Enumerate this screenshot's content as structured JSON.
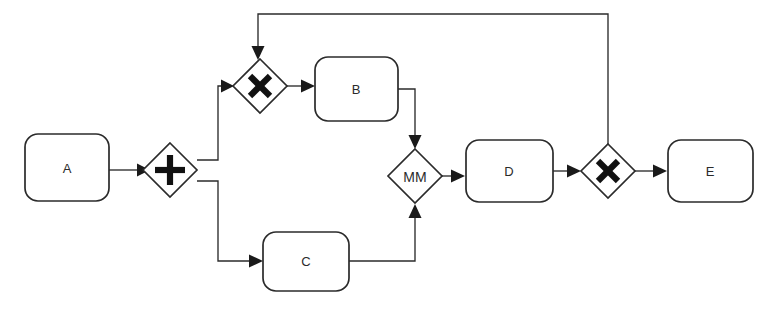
{
  "diagram": {
    "type": "bpmn-process-flow",
    "title": "",
    "background_color": "#ffffff",
    "line_color": "#2b2b2b",
    "fill_color": "#ffffff",
    "tasks": [
      {
        "id": "A",
        "label": "A",
        "x": 25,
        "y": 134,
        "width": 84,
        "height": 67
      },
      {
        "id": "B",
        "label": "B",
        "x": 315,
        "y": 57,
        "width": 83,
        "height": 64
      },
      {
        "id": "C",
        "label": "C",
        "x": 263,
        "y": 232,
        "width": 86,
        "height": 59
      },
      {
        "id": "D",
        "label": "D",
        "x": 466,
        "y": 140,
        "width": 87,
        "height": 62
      },
      {
        "id": "E",
        "label": "E",
        "x": 668,
        "y": 140,
        "width": 85,
        "height": 62
      }
    ],
    "gateways": [
      {
        "id": "G1",
        "label": "",
        "marker": "plus",
        "kind": "parallel-split",
        "cx": 170,
        "cy": 170,
        "r": 27
      },
      {
        "id": "G2",
        "label": "",
        "marker": "cross",
        "kind": "exclusive-merge",
        "cx": 260,
        "cy": 86,
        "r": 27
      },
      {
        "id": "G3",
        "label": "MM",
        "marker": "text",
        "kind": "merge",
        "cx": 415,
        "cy": 176,
        "r": 27
      },
      {
        "id": "G4",
        "label": "",
        "marker": "cross",
        "kind": "exclusive-split",
        "cx": 608,
        "cy": 171,
        "r": 27
      }
    ],
    "flows": [
      {
        "id": "f1",
        "from": "A",
        "to": "G1",
        "label": ""
      },
      {
        "id": "f2",
        "from": "G1",
        "to": "G2",
        "label": ""
      },
      {
        "id": "f3",
        "from": "G1",
        "to": "C",
        "label": ""
      },
      {
        "id": "f4",
        "from": "G2",
        "to": "B",
        "label": ""
      },
      {
        "id": "f5",
        "from": "B",
        "to": "G3",
        "label": ""
      },
      {
        "id": "f6",
        "from": "C",
        "to": "G3",
        "label": ""
      },
      {
        "id": "f7",
        "from": "G3",
        "to": "D",
        "label": ""
      },
      {
        "id": "f8",
        "from": "D",
        "to": "G4",
        "label": ""
      },
      {
        "id": "f9",
        "from": "G4",
        "to": "E",
        "label": ""
      },
      {
        "id": "f10",
        "from": "G4",
        "to": "G2",
        "label": ""
      }
    ]
  }
}
